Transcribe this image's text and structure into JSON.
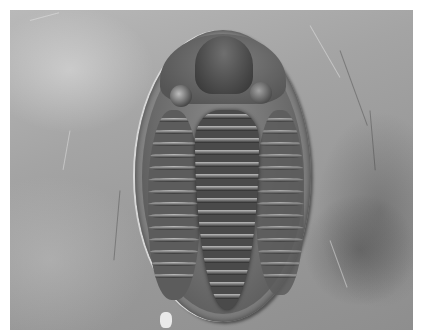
{
  "image": {
    "subject": "trilobite fossil",
    "description": "Black-and-white photograph of an oval trilobite fossil embedded in grey rock matrix",
    "colors": {
      "rock_light": "#b9b9b9",
      "rock_dark": "#8e8e8e",
      "fossil_rim": "#7c7c7c",
      "fossil_dark": "#3c3c3c",
      "highlight": "#d8d8d8",
      "border": "#ffffff"
    },
    "features": [
      "cephalon",
      "glabella",
      "eyes",
      "thorax segments",
      "axial lobe",
      "pleural lobes",
      "pygidium"
    ]
  }
}
